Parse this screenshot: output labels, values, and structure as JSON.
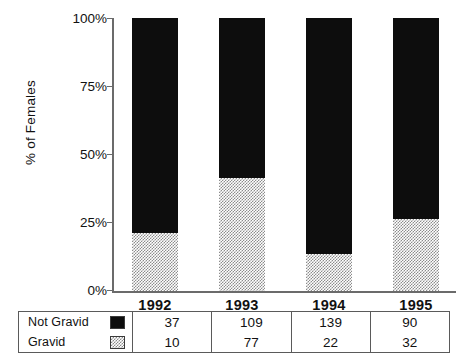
{
  "chart_data": {
    "type": "bar",
    "stacked": true,
    "normalized": true,
    "title": "",
    "xlabel": "",
    "ylabel": "% of Females",
    "ylim": [
      0,
      100
    ],
    "ytick_labels": [
      "100%",
      "75%",
      "50%",
      "25%",
      "0%"
    ],
    "ytick_values": [
      100,
      75,
      50,
      25,
      0
    ],
    "grid": false,
    "legend_position": "bottom-table",
    "categories": [
      "1992",
      "1993",
      "1994",
      "1995"
    ],
    "series": [
      {
        "name": "Not Gravid",
        "counts": [
          37,
          109,
          139,
          90
        ],
        "percent": [
          78.7,
          58.6,
          86.3,
          73.8
        ],
        "color": "#0d0d0d",
        "pattern": "solid"
      },
      {
        "name": "Gravid",
        "counts": [
          10,
          77,
          22,
          32
        ],
        "percent": [
          21.3,
          41.4,
          13.7,
          26.2
        ],
        "color": "#8c8c8c",
        "pattern": "checker-hatch"
      }
    ]
  },
  "table": {
    "rows": [
      {
        "label": "Not Gravid",
        "swatch": "black-swatch",
        "values": [
          "37",
          "109",
          "139",
          "90"
        ]
      },
      {
        "label": "Gravid",
        "swatch": "hatched-swatch",
        "values": [
          "10",
          "77",
          "22",
          "32"
        ]
      }
    ]
  }
}
